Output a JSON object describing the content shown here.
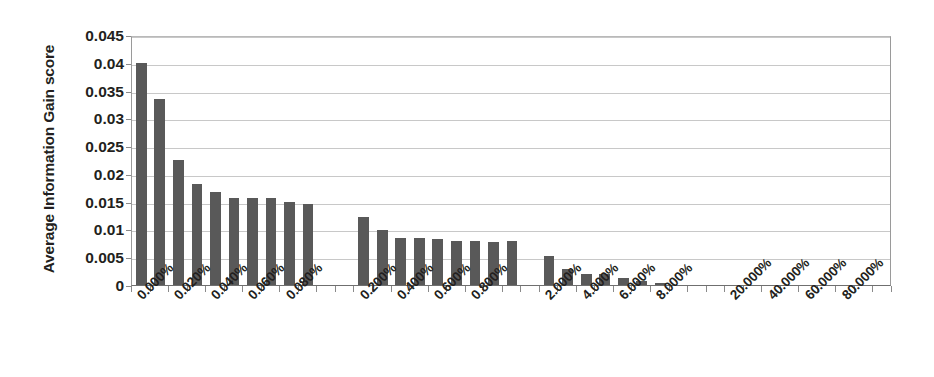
{
  "chart_data": {
    "type": "bar",
    "title": "",
    "subtitle": "",
    "xlabel": "",
    "ylabel": "Average Information Gain score",
    "ylim": [
      0,
      0.045
    ],
    "y_ticks": [
      "0",
      "0.005",
      "0.01",
      "0.015",
      "0.02",
      "0.025",
      "0.03",
      "0.035",
      "0.04",
      "0.045"
    ],
    "y_tick_values": [
      0,
      0.005,
      0.01,
      0.015,
      0.02,
      0.025,
      0.03,
      0.035,
      0.04,
      0.045
    ],
    "grid": true,
    "legend": "none",
    "x_tick_labels": [
      "0.000%",
      "0.020%",
      "0.040%",
      "0.060%",
      "0.080%",
      "0.200%",
      "0.400%",
      "0.600%",
      "0.800%",
      "2.000%",
      "4.000%",
      "6.000%",
      "8.000%",
      "20.000%",
      "40.000%",
      "60.000%",
      "80.000%"
    ],
    "x_tick_slots": [
      0,
      2,
      4,
      6,
      8,
      12,
      14,
      16,
      18,
      22,
      24,
      26,
      28,
      32,
      34,
      36,
      38
    ],
    "n_slots": 41,
    "bar_color": "#595959",
    "categories": [
      "0.000%",
      "0.010%",
      "0.020%",
      "0.030%",
      "0.040%",
      "0.050%",
      "0.060%",
      "0.070%",
      "0.080%",
      "0.090%",
      "0.200%",
      "0.300%",
      "0.400%",
      "0.500%",
      "0.600%",
      "0.700%",
      "0.800%",
      "0.900%",
      "2.000%",
      "3.000%",
      "4.000%",
      "5.000%",
      "6.000%",
      "7.000%",
      "8.000%",
      "9.000%",
      "20.000%",
      "30.000%",
      "40.000%",
      "50.000%",
      "60.000%",
      "70.000%",
      "80.000%",
      "90.000%"
    ],
    "bars": [
      {
        "slot": 0,
        "label": "0.000%",
        "value": 0.04
      },
      {
        "slot": 1,
        "label": "0.010%",
        "value": 0.0335
      },
      {
        "slot": 2,
        "label": "0.020%",
        "value": 0.0225
      },
      {
        "slot": 3,
        "label": "0.030%",
        "value": 0.0181
      },
      {
        "slot": 4,
        "label": "0.040%",
        "value": 0.0168
      },
      {
        "slot": 5,
        "label": "0.050%",
        "value": 0.0156
      },
      {
        "slot": 6,
        "label": "0.060%",
        "value": 0.0157
      },
      {
        "slot": 7,
        "label": "0.070%",
        "value": 0.0157
      },
      {
        "slot": 8,
        "label": "0.080%",
        "value": 0.0149
      },
      {
        "slot": 9,
        "label": "0.090%",
        "value": 0.0146
      },
      {
        "slot": 12,
        "label": "0.200%",
        "value": 0.0122
      },
      {
        "slot": 13,
        "label": "0.300%",
        "value": 0.0099
      },
      {
        "slot": 14,
        "label": "0.400%",
        "value": 0.0085
      },
      {
        "slot": 15,
        "label": "0.500%",
        "value": 0.0084
      },
      {
        "slot": 16,
        "label": "0.600%",
        "value": 0.0083
      },
      {
        "slot": 17,
        "label": "0.700%",
        "value": 0.0079
      },
      {
        "slot": 18,
        "label": "0.800%",
        "value": 0.0079
      },
      {
        "slot": 19,
        "label": "0.900%",
        "value": 0.0078
      },
      {
        "slot": 20,
        "label": "1.000%",
        "value": 0.0079
      },
      {
        "slot": 22,
        "label": "2.000%",
        "value": 0.0053
      },
      {
        "slot": 23,
        "label": "3.000%",
        "value": 0.0028
      },
      {
        "slot": 24,
        "label": "4.000%",
        "value": 0.002
      },
      {
        "slot": 25,
        "label": "5.000%",
        "value": 0.0019
      },
      {
        "slot": 26,
        "label": "6.000%",
        "value": 0.0012
      },
      {
        "slot": 27,
        "label": "7.000%",
        "value": 0.0008
      },
      {
        "slot": 28,
        "label": "8.000%",
        "value": 0.0004
      },
      {
        "slot": 29,
        "label": "9.000%",
        "value": 0.0001
      },
      {
        "slot": 32,
        "label": "20.000%",
        "value": 0.0
      },
      {
        "slot": 34,
        "label": "40.000%",
        "value": 0.0
      },
      {
        "slot": 36,
        "label": "60.000%",
        "value": 0.0
      },
      {
        "slot": 38,
        "label": "80.000%",
        "value": 0.0
      }
    ]
  }
}
